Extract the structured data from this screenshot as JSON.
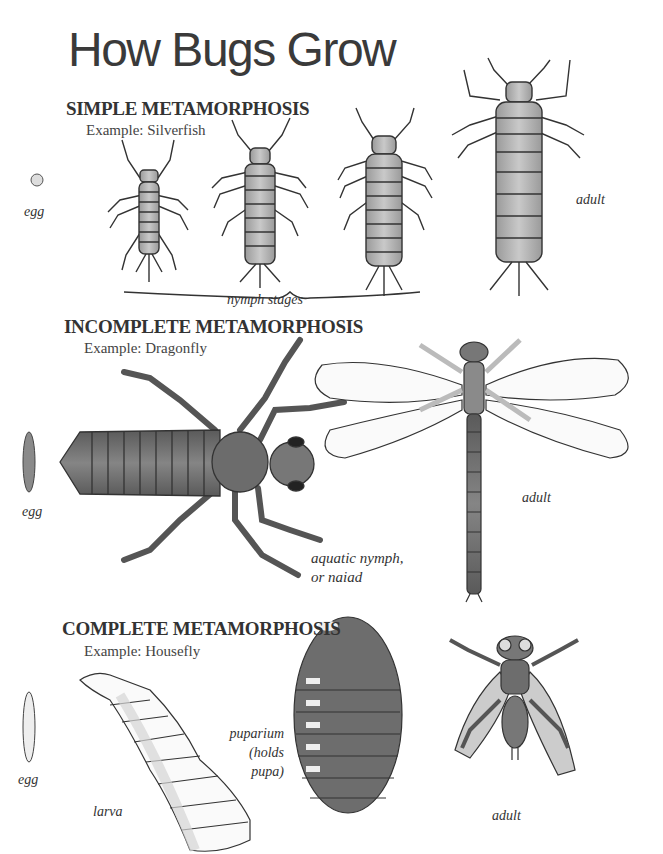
{
  "title": "How Bugs Grow",
  "sections": [
    {
      "heading": "SIMPLE METAMORPHOSIS",
      "example": "Example: Silverfish",
      "labels": {
        "egg": "egg",
        "nymph": "nymph stages",
        "adult": "adult"
      }
    },
    {
      "heading": "INCOMPLETE METAMORPHOSIS",
      "example": "Example: Dragonfly",
      "labels": {
        "egg": "egg",
        "nymph_line1": "aquatic nymph,",
        "nymph_line2": "or naiad",
        "adult": "adult"
      }
    },
    {
      "heading": "COMPLETE METAMORPHOSIS",
      "example": "Example: Housefly",
      "labels": {
        "egg": "egg",
        "larva": "larva",
        "puparium_line1": "puparium",
        "puparium_line2": "(holds",
        "puparium_line3": "pupa)",
        "adult": "adult"
      }
    }
  ],
  "colors": {
    "ink": "#333333",
    "body_fill": "#b8b8b8",
    "dark_fill": "#6e6e6e",
    "wing_fill": "#f4f4f4"
  }
}
